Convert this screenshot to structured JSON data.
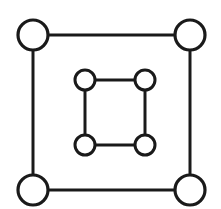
{
  "figure": {
    "background_color": "#ffffff",
    "stroke_color": "#1a1a1a",
    "node_fill_color": "#ffffff",
    "canvas": {
      "width": 221,
      "height": 209
    }
  },
  "chart_data": {
    "type": "diagram",
    "title": "",
    "graph_kind": "node-link",
    "layout": "two nested square cycles, unconnected to each other",
    "node_count": 8,
    "edge_count": 8,
    "nodes": [
      {
        "id": "outer-tl",
        "group": "outer",
        "label": "",
        "cx": 33,
        "cy": 35,
        "r": 15,
        "corner": "top-left"
      },
      {
        "id": "outer-tr",
        "group": "outer",
        "label": "",
        "cx": 190,
        "cy": 35,
        "r": 15,
        "corner": "top-right"
      },
      {
        "id": "outer-br",
        "group": "outer",
        "label": "",
        "cx": 190,
        "cy": 190,
        "r": 15,
        "corner": "bottom-right"
      },
      {
        "id": "outer-bl",
        "group": "outer",
        "label": "",
        "cx": 33,
        "cy": 190,
        "r": 15,
        "corner": "bottom-left"
      },
      {
        "id": "inner-tl",
        "group": "inner",
        "label": "",
        "cx": 85,
        "cy": 80,
        "r": 10,
        "corner": "top-left"
      },
      {
        "id": "inner-tr",
        "group": "inner",
        "label": "",
        "cx": 145,
        "cy": 80,
        "r": 10,
        "corner": "top-right"
      },
      {
        "id": "inner-br",
        "group": "inner",
        "label": "",
        "cx": 145,
        "cy": 145,
        "r": 10,
        "corner": "bottom-right"
      },
      {
        "id": "inner-bl",
        "group": "inner",
        "label": "",
        "cx": 85,
        "cy": 145,
        "r": 10,
        "corner": "bottom-left"
      }
    ],
    "edges": [
      {
        "id": "outer-top",
        "from": "outer-tl",
        "to": "outer-tr",
        "x1": 33,
        "y1": 35,
        "x2": 190,
        "y2": 35
      },
      {
        "id": "outer-right",
        "from": "outer-tr",
        "to": "outer-br",
        "x1": 190,
        "y1": 35,
        "x2": 190,
        "y2": 190
      },
      {
        "id": "outer-bottom",
        "from": "outer-br",
        "to": "outer-bl",
        "x1": 190,
        "y1": 190,
        "x2": 33,
        "y2": 190
      },
      {
        "id": "outer-left",
        "from": "outer-bl",
        "to": "outer-tl",
        "x1": 33,
        "y1": 190,
        "x2": 33,
        "y2": 35
      },
      {
        "id": "inner-top",
        "from": "inner-tl",
        "to": "inner-tr",
        "x1": 85,
        "y1": 80,
        "x2": 145,
        "y2": 80
      },
      {
        "id": "inner-right",
        "from": "inner-tr",
        "to": "inner-br",
        "x1": 145,
        "y1": 80,
        "x2": 145,
        "y2": 145
      },
      {
        "id": "inner-bottom",
        "from": "inner-br",
        "to": "inner-bl",
        "x1": 145,
        "y1": 145,
        "x2": 85,
        "y2": 145
      },
      {
        "id": "inner-left",
        "from": "inner-bl",
        "to": "inner-tl",
        "x1": 85,
        "y1": 145,
        "x2": 85,
        "y2": 80
      }
    ],
    "stroke_width_edge": 3,
    "stroke_width_node_outer": 3.2,
    "stroke_width_node_inner": 3
  }
}
